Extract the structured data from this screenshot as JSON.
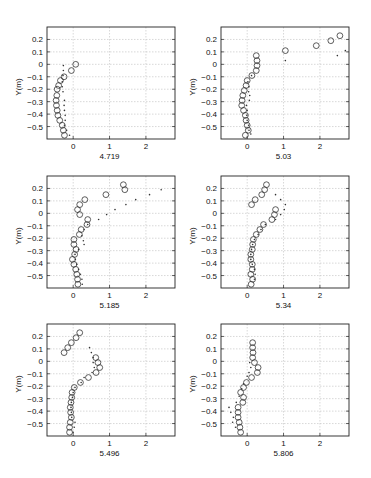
{
  "figure": {
    "width": 371,
    "height": 478,
    "colors": {
      "axis": "#222222",
      "grid": "#bdbdbd",
      "marker": "#333333",
      "background": "#ffffff"
    }
  },
  "chart_data": [
    {
      "type": "scatter",
      "title": "",
      "xlabel": "4.719",
      "ylabel": "Y(m)",
      "xlim": [
        -0.72,
        2.8
      ],
      "ylim": [
        -0.6,
        0.3
      ],
      "xticks": [
        0,
        1,
        2
      ],
      "yticks": [
        0.2,
        0.1,
        0,
        -0.1,
        -0.2,
        -0.3,
        -0.4,
        -0.5
      ],
      "grid": true,
      "series": [
        {
          "name": "circles",
          "marker": "circle",
          "points": [
            [
              0.07,
              0.0
            ],
            [
              -0.05,
              -0.05
            ],
            [
              -0.25,
              -0.1
            ],
            [
              -0.35,
              -0.13
            ],
            [
              -0.4,
              -0.17
            ],
            [
              -0.44,
              -0.2
            ],
            [
              -0.45,
              -0.25
            ],
            [
              -0.47,
              -0.29
            ],
            [
              -0.46,
              -0.33
            ],
            [
              -0.44,
              -0.37
            ],
            [
              -0.42,
              -0.41
            ],
            [
              -0.37,
              -0.45
            ],
            [
              -0.3,
              -0.49
            ],
            [
              -0.27,
              -0.53
            ],
            [
              -0.24,
              -0.57
            ]
          ]
        },
        {
          "name": "dots",
          "marker": "dot",
          "points": [
            [
              -0.27,
              -0.01
            ],
            [
              -0.27,
              -0.05
            ],
            [
              -0.28,
              -0.09
            ],
            [
              -0.3,
              -0.14
            ],
            [
              -0.3,
              -0.18
            ],
            [
              -0.28,
              -0.22
            ],
            [
              -0.24,
              -0.29
            ],
            [
              -0.25,
              -0.33
            ],
            [
              -0.24,
              -0.37
            ],
            [
              -0.22,
              -0.41
            ],
            [
              -0.22,
              -0.45
            ],
            [
              -0.24,
              -0.49
            ],
            [
              -0.18,
              -0.53
            ],
            [
              -0.1,
              -0.57
            ]
          ]
        }
      ]
    },
    {
      "type": "scatter",
      "title": "",
      "xlabel": "5.03",
      "ylabel": "Y(m)",
      "xlim": [
        -0.72,
        2.8
      ],
      "ylim": [
        -0.6,
        0.3
      ],
      "xticks": [
        0,
        1,
        2
      ],
      "yticks": [
        0.2,
        0.1,
        0,
        -0.1,
        -0.2,
        -0.3,
        -0.4,
        -0.5
      ],
      "grid": true,
      "series": [
        {
          "name": "circles",
          "marker": "circle",
          "points": [
            [
              2.55,
              0.23
            ],
            [
              2.3,
              0.19
            ],
            [
              1.9,
              0.15
            ],
            [
              1.05,
              0.11
            ],
            [
              0.25,
              0.07
            ],
            [
              0.27,
              0.03
            ],
            [
              0.27,
              -0.01
            ],
            [
              0.25,
              -0.05
            ],
            [
              0.13,
              -0.09
            ],
            [
              0.0,
              -0.13
            ],
            [
              -0.03,
              -0.17
            ],
            [
              -0.08,
              -0.21
            ],
            [
              -0.12,
              -0.25
            ],
            [
              -0.14,
              -0.29
            ],
            [
              -0.15,
              -0.33
            ],
            [
              -0.1,
              -0.37
            ],
            [
              -0.05,
              -0.41
            ],
            [
              -0.03,
              -0.45
            ],
            [
              0.0,
              -0.49
            ],
            [
              0.03,
              -0.53
            ],
            [
              -0.05,
              -0.57
            ]
          ]
        },
        {
          "name": "dots",
          "marker": "dot",
          "points": [
            [
              2.7,
              0.11
            ],
            [
              2.48,
              0.07
            ],
            [
              1.05,
              0.03
            ],
            [
              0.12,
              -0.09
            ],
            [
              0.02,
              -0.14
            ],
            [
              0.05,
              -0.18
            ],
            [
              0.04,
              -0.22
            ],
            [
              0.07,
              -0.25
            ],
            [
              0.06,
              -0.29
            ],
            [
              -0.02,
              -0.33
            ],
            [
              0.0,
              -0.37
            ],
            [
              -0.01,
              -0.41
            ],
            [
              0.0,
              -0.45
            ],
            [
              0.04,
              -0.49
            ],
            [
              0.05,
              -0.53
            ],
            [
              0.1,
              -0.56
            ]
          ]
        }
      ]
    },
    {
      "type": "scatter",
      "title": "",
      "xlabel": "5.185",
      "ylabel": "Y(m)",
      "xlim": [
        -0.72,
        2.8
      ],
      "ylim": [
        -0.6,
        0.3
      ],
      "xticks": [
        0,
        1,
        2
      ],
      "yticks": [
        0.2,
        0.1,
        0,
        -0.1,
        -0.2,
        -0.3,
        -0.4,
        -0.5
      ],
      "grid": true,
      "series": [
        {
          "name": "circles",
          "marker": "circle",
          "points": [
            [
              1.38,
              0.23
            ],
            [
              1.42,
              0.19
            ],
            [
              0.9,
              0.15
            ],
            [
              0.32,
              0.11
            ],
            [
              0.18,
              0.07
            ],
            [
              0.12,
              0.03
            ],
            [
              0.18,
              -0.01
            ],
            [
              0.4,
              -0.05
            ],
            [
              0.38,
              -0.09
            ],
            [
              0.22,
              -0.13
            ],
            [
              0.17,
              -0.17
            ],
            [
              0.02,
              -0.21
            ],
            [
              0.02,
              -0.25
            ],
            [
              0.08,
              -0.29
            ],
            [
              0.04,
              -0.33
            ],
            [
              -0.02,
              -0.37
            ],
            [
              0.02,
              -0.41
            ],
            [
              0.07,
              -0.45
            ],
            [
              0.1,
              -0.49
            ],
            [
              0.12,
              -0.53
            ],
            [
              0.13,
              -0.57
            ]
          ]
        },
        {
          "name": "dots",
          "marker": "dot",
          "points": [
            [
              2.42,
              0.19
            ],
            [
              2.1,
              0.15
            ],
            [
              1.72,
              0.11
            ],
            [
              1.45,
              0.07
            ],
            [
              1.15,
              0.03
            ],
            [
              0.92,
              -0.01
            ],
            [
              0.7,
              -0.05
            ],
            [
              0.4,
              -0.09
            ],
            [
              0.3,
              -0.13
            ],
            [
              0.24,
              -0.18
            ],
            [
              0.28,
              -0.22
            ],
            [
              0.3,
              -0.25
            ],
            [
              0.15,
              -0.29
            ],
            [
              0.05,
              -0.33
            ],
            [
              0.06,
              -0.37
            ],
            [
              0.1,
              -0.41
            ],
            [
              0.15,
              -0.45
            ],
            [
              0.2,
              -0.49
            ],
            [
              0.24,
              -0.53
            ],
            [
              0.25,
              -0.57
            ]
          ]
        }
      ]
    },
    {
      "type": "scatter",
      "title": "",
      "xlabel": "5.34",
      "ylabel": "Y(m)",
      "xlim": [
        -0.72,
        2.8
      ],
      "ylim": [
        -0.6,
        0.3
      ],
      "xticks": [
        0,
        1,
        2
      ],
      "yticks": [
        0.2,
        0.1,
        0,
        -0.1,
        -0.2,
        -0.3,
        -0.4,
        -0.5
      ],
      "grid": true,
      "series": [
        {
          "name": "circles",
          "marker": "circle",
          "points": [
            [
              0.53,
              0.23
            ],
            [
              0.48,
              0.19
            ],
            [
              0.4,
              0.15
            ],
            [
              0.22,
              0.11
            ],
            [
              0.12,
              0.07
            ],
            [
              0.78,
              0.03
            ],
            [
              0.75,
              -0.01
            ],
            [
              0.68,
              -0.05
            ],
            [
              0.45,
              -0.09
            ],
            [
              0.35,
              -0.13
            ],
            [
              0.25,
              -0.17
            ],
            [
              0.17,
              -0.21
            ],
            [
              0.15,
              -0.25
            ],
            [
              0.14,
              -0.29
            ],
            [
              0.1,
              -0.33
            ],
            [
              0.1,
              -0.37
            ],
            [
              0.14,
              -0.41
            ],
            [
              0.14,
              -0.45
            ],
            [
              0.1,
              -0.49
            ],
            [
              0.15,
              -0.53
            ],
            [
              0.11,
              -0.57
            ]
          ]
        },
        {
          "name": "dots",
          "marker": "dot",
          "points": [
            [
              0.78,
              0.15
            ],
            [
              0.92,
              0.11
            ],
            [
              1.05,
              0.07
            ],
            [
              1.02,
              0.03
            ],
            [
              0.92,
              -0.01
            ],
            [
              0.78,
              -0.05
            ],
            [
              0.5,
              -0.09
            ],
            [
              0.38,
              -0.13
            ],
            [
              0.3,
              -0.17
            ],
            [
              0.2,
              -0.21
            ],
            [
              0.15,
              -0.25
            ],
            [
              0.12,
              -0.29
            ],
            [
              0.1,
              -0.33
            ],
            [
              0.1,
              -0.37
            ],
            [
              0.14,
              -0.41
            ],
            [
              0.2,
              -0.45
            ],
            [
              0.22,
              -0.49
            ],
            [
              0.2,
              -0.53
            ]
          ]
        }
      ]
    },
    {
      "type": "scatter",
      "title": "",
      "xlabel": "5.496",
      "ylabel": "Y(m)",
      "xlim": [
        -0.72,
        2.8
      ],
      "ylim": [
        -0.6,
        0.3
      ],
      "xticks": [
        0,
        1,
        2
      ],
      "yticks": [
        0.2,
        0.1,
        0,
        -0.1,
        -0.2,
        -0.3,
        -0.4,
        -0.5
      ],
      "grid": true,
      "series": [
        {
          "name": "circles",
          "marker": "circle",
          "points": [
            [
              0.18,
              0.23
            ],
            [
              0.08,
              0.19
            ],
            [
              -0.05,
              0.15
            ],
            [
              -0.15,
              0.11
            ],
            [
              -0.25,
              0.07
            ],
            [
              0.62,
              0.03
            ],
            [
              0.68,
              -0.01
            ],
            [
              0.73,
              -0.05
            ],
            [
              0.63,
              -0.09
            ],
            [
              0.42,
              -0.13
            ],
            [
              0.2,
              -0.17
            ],
            [
              0.03,
              -0.21
            ],
            [
              -0.03,
              -0.25
            ],
            [
              -0.04,
              -0.29
            ],
            [
              -0.06,
              -0.33
            ],
            [
              -0.08,
              -0.37
            ],
            [
              -0.07,
              -0.41
            ],
            [
              -0.05,
              -0.45
            ],
            [
              -0.08,
              -0.49
            ],
            [
              -0.1,
              -0.53
            ],
            [
              -0.1,
              -0.57
            ]
          ]
        },
        {
          "name": "dots",
          "marker": "dot",
          "points": [
            [
              0.45,
              0.11
            ],
            [
              0.5,
              0.07
            ],
            [
              0.55,
              0.03
            ],
            [
              0.55,
              -0.01
            ],
            [
              0.58,
              -0.05
            ],
            [
              0.52,
              -0.09
            ],
            [
              0.3,
              -0.13
            ],
            [
              0.22,
              -0.17
            ],
            [
              0.05,
              -0.21
            ],
            [
              0.0,
              -0.25
            ],
            [
              -0.02,
              -0.29
            ],
            [
              -0.05,
              -0.33
            ],
            [
              -0.06,
              -0.37
            ],
            [
              -0.05,
              -0.41
            ],
            [
              -0.04,
              -0.45
            ],
            [
              0.05,
              -0.49
            ],
            [
              0.03,
              -0.53
            ],
            [
              0.0,
              -0.57
            ]
          ]
        }
      ]
    },
    {
      "type": "scatter",
      "title": "",
      "xlabel": "5.806",
      "ylabel": "Y(m)",
      "xlim": [
        -0.72,
        2.8
      ],
      "ylim": [
        -0.6,
        0.3
      ],
      "xticks": [
        0,
        1,
        2
      ],
      "yticks": [
        0.2,
        0.1,
        0,
        -0.1,
        -0.2,
        -0.3,
        -0.4,
        -0.5
      ],
      "grid": true,
      "series": [
        {
          "name": "circles",
          "marker": "circle",
          "points": [
            [
              0.15,
              0.15
            ],
            [
              0.15,
              0.11
            ],
            [
              0.16,
              0.07
            ],
            [
              0.15,
              0.03
            ],
            [
              0.2,
              -0.01
            ],
            [
              0.3,
              -0.05
            ],
            [
              0.28,
              -0.09
            ],
            [
              0.12,
              -0.13
            ],
            [
              -0.02,
              -0.17
            ],
            [
              -0.1,
              -0.21
            ],
            [
              -0.18,
              -0.25
            ],
            [
              -0.1,
              -0.29
            ],
            [
              -0.12,
              -0.33
            ],
            [
              -0.25,
              -0.37
            ],
            [
              -0.25,
              -0.41
            ],
            [
              -0.25,
              -0.45
            ],
            [
              -0.22,
              -0.49
            ],
            [
              -0.2,
              -0.53
            ],
            [
              -0.18,
              -0.57
            ]
          ]
        },
        {
          "name": "dots",
          "marker": "dot",
          "points": [
            [
              0.07,
              -0.01
            ],
            [
              0.1,
              -0.05
            ],
            [
              0.05,
              -0.09
            ],
            [
              0.0,
              -0.12
            ],
            [
              -0.1,
              -0.18
            ],
            [
              -0.15,
              -0.22
            ],
            [
              -0.22,
              -0.28
            ],
            [
              -0.3,
              -0.33
            ],
            [
              -0.5,
              -0.37
            ],
            [
              -0.45,
              -0.41
            ],
            [
              -0.38,
              -0.45
            ],
            [
              -0.4,
              -0.49
            ],
            [
              -0.32,
              -0.53
            ]
          ]
        }
      ]
    }
  ],
  "layout": {
    "panels": [
      {
        "x": 47,
        "y": 27,
        "w": 128,
        "h": 112
      },
      {
        "x": 221,
        "y": 27,
        "w": 128,
        "h": 112
      },
      {
        "x": 47,
        "y": 176,
        "w": 128,
        "h": 112
      },
      {
        "x": 221,
        "y": 176,
        "w": 128,
        "h": 112
      },
      {
        "x": 47,
        "y": 324,
        "w": 128,
        "h": 112
      },
      {
        "x": 221,
        "y": 324,
        "w": 128,
        "h": 112
      }
    ]
  }
}
